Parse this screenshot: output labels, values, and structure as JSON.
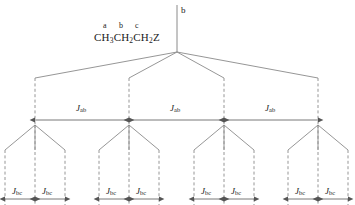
{
  "diagram": {
    "background_color": "#ffffff",
    "line_color": "#8a8a8a",
    "arrow_color": "#555555",
    "text_color": "#1a1a1a",
    "molecule": {
      "formula_parts": [
        {
          "text": "CH",
          "sub": "3"
        },
        {
          "text": "CH",
          "sub": "2"
        },
        {
          "text": "CH",
          "sub": "2"
        },
        {
          "text": "Z",
          "sub": ""
        }
      ],
      "formula_plain": "CH3CH2CH2Z",
      "atom_labels": [
        "a",
        "b",
        "c"
      ]
    },
    "root": {
      "label": "b",
      "stem_x": 177,
      "stem_top_y": 5,
      "stem_bottom_y": 52
    },
    "first_split": {
      "coupling_label": {
        "symbol": "J",
        "subscript": "ab"
      },
      "multiplicity": 4,
      "node_x": [
        35,
        129,
        224,
        318
      ],
      "arrow_y": 120,
      "label_y": 106,
      "label_x": [
        82,
        176,
        271
      ],
      "branch_start_y": 52,
      "branch_end_y": 78,
      "vertical_end_y": 125
    },
    "second_split": {
      "coupling_label": {
        "symbol": "J",
        "subscript": "bc"
      },
      "multiplicity": 3,
      "groups": [
        {
          "center_x": 35,
          "node_x": [
            5,
            35,
            65
          ]
        },
        {
          "center_x": 129,
          "node_x": [
            99,
            129,
            159
          ]
        },
        {
          "center_x": 224,
          "node_x": [
            194,
            224,
            254
          ]
        },
        {
          "center_x": 318,
          "node_x": [
            288,
            318,
            348
          ]
        }
      ],
      "arrow_y": 199,
      "label_y": 188,
      "branch_start_y": 125,
      "branch_end_y": 150,
      "vertical_end_y": 205
    },
    "j_ab_label_text": "Jab",
    "j_bc_label_text": "Jbc"
  }
}
